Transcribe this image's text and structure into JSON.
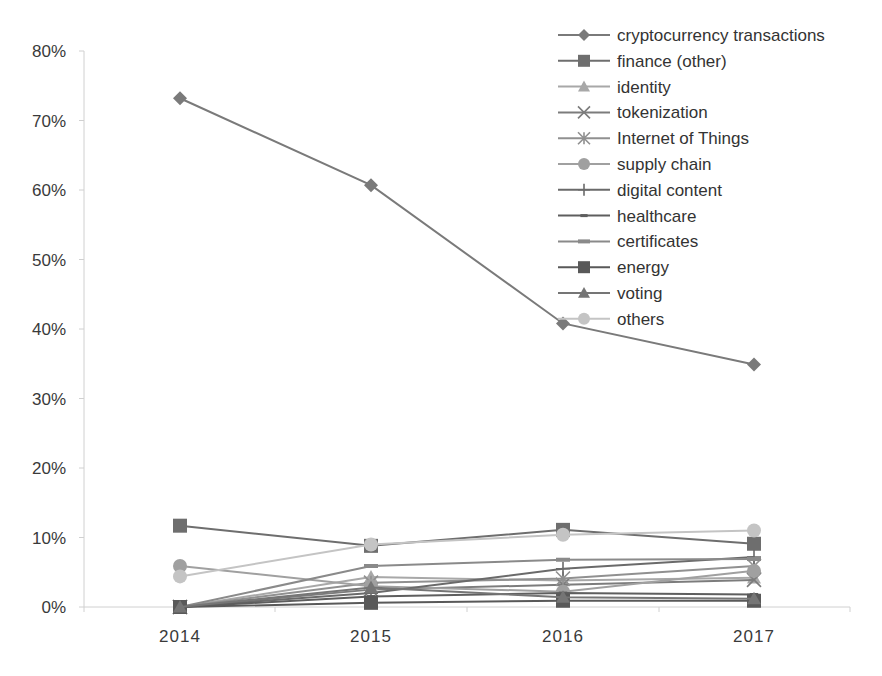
{
  "chart_data": {
    "type": "line",
    "title": "",
    "xlabel": "",
    "ylabel": "",
    "categories": [
      "2014",
      "2015",
      "2016",
      "2017"
    ],
    "ylim": [
      0,
      80
    ],
    "y_ticks": [
      "0%",
      "10%",
      "20%",
      "30%",
      "40%",
      "50%",
      "60%",
      "70%",
      "80%"
    ],
    "grid": false,
    "legend_position": "top-right (inside plot)",
    "series": [
      {
        "name": "cryptocurrency transactions",
        "marker": "diamond",
        "color": "#7a7a7a",
        "values": [
          73.2,
          60.7,
          40.8,
          34.9
        ]
      },
      {
        "name": "finance (other)",
        "marker": "square",
        "color": "#6e6e6e",
        "values": [
          11.7,
          8.8,
          11.1,
          9.1
        ]
      },
      {
        "name": "identity",
        "marker": "triangle",
        "color": "#a8a8a8",
        "values": [
          0.0,
          4.3,
          3.8,
          4.2
        ]
      },
      {
        "name": "tokenization",
        "marker": "x",
        "color": "#7c7c7c",
        "values": [
          0.0,
          2.5,
          3.2,
          3.9
        ]
      },
      {
        "name": "Internet of Things",
        "marker": "asterisk",
        "color": "#909090",
        "values": [
          0.0,
          3.5,
          4.1,
          5.9
        ]
      },
      {
        "name": "supply chain",
        "marker": "circle",
        "color": "#a0a0a0",
        "values": [
          5.9,
          3.0,
          2.2,
          5.2
        ]
      },
      {
        "name": "digital content",
        "marker": "plus",
        "color": "#6a6a6a",
        "values": [
          0.0,
          2.0,
          5.5,
          7.2
        ]
      },
      {
        "name": "healthcare",
        "marker": "dash",
        "color": "#5e5e5e",
        "values": [
          0.0,
          1.5,
          2.0,
          1.8
        ]
      },
      {
        "name": "certificates",
        "marker": "long-dash",
        "color": "#8a8a8a",
        "values": [
          0.0,
          5.9,
          6.8,
          6.9
        ]
      },
      {
        "name": "energy",
        "marker": "square",
        "color": "#595959",
        "values": [
          0.0,
          0.6,
          0.9,
          0.9
        ]
      },
      {
        "name": "voting",
        "marker": "triangle",
        "color": "#757575",
        "values": [
          0.0,
          2.8,
          1.4,
          1.2
        ]
      },
      {
        "name": "others",
        "marker": "circle",
        "color": "#c4c4c4",
        "values": [
          4.4,
          9.0,
          10.4,
          11.0
        ]
      }
    ]
  }
}
